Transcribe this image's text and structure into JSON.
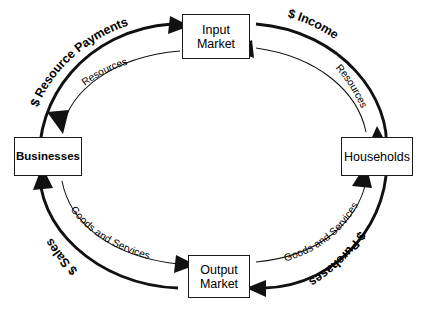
{
  "diagram": {
    "type": "circular-flow",
    "background_color": "#ffffff",
    "line_color": "#111111",
    "text_color": "#000000",
    "nodes": [
      {
        "id": "input-market",
        "line1": "Input",
        "line2": "Market",
        "position": "top"
      },
      {
        "id": "businesses",
        "line1": "Businesses",
        "line2": "",
        "position": "left"
      },
      {
        "id": "households",
        "line1": "Households",
        "line2": "",
        "position": "right"
      },
      {
        "id": "output-market",
        "line1": "Output",
        "line2": "Market",
        "position": "bottom"
      }
    ],
    "flows": [
      {
        "id": "resource-payments",
        "label": "$ Resource  Payments",
        "ring": "outer",
        "quadrant": "upper-left",
        "from": "businesses",
        "to": "input-market",
        "direction": "clockwise"
      },
      {
        "id": "resources-left",
        "label": "Resources",
        "ring": "inner",
        "quadrant": "upper-left",
        "from": "input-market",
        "to": "businesses",
        "direction": "counter-clockwise"
      },
      {
        "id": "income",
        "label": "$ Income",
        "ring": "outer",
        "quadrant": "upper-right",
        "from": "input-market",
        "to": "households",
        "direction": "clockwise"
      },
      {
        "id": "resources-right",
        "label": "Resources",
        "ring": "inner",
        "quadrant": "upper-right",
        "from": "households",
        "to": "input-market",
        "direction": "counter-clockwise"
      },
      {
        "id": "sales",
        "label": "$ Sales",
        "ring": "outer",
        "quadrant": "lower-left",
        "from": "output-market",
        "to": "businesses",
        "direction": "clockwise"
      },
      {
        "id": "goods-services-left",
        "label": "Goods and Services",
        "ring": "inner",
        "quadrant": "lower-left",
        "from": "businesses",
        "to": "output-market",
        "direction": "counter-clockwise"
      },
      {
        "id": "purchases",
        "label": "$ Purchases",
        "ring": "outer",
        "quadrant": "lower-right",
        "from": "households",
        "to": "output-market",
        "direction": "clockwise"
      },
      {
        "id": "goods-services-right",
        "label": "Goods and Services",
        "ring": "inner",
        "quadrant": "lower-right",
        "from": "output-market",
        "to": "households",
        "direction": "counter-clockwise"
      }
    ]
  }
}
